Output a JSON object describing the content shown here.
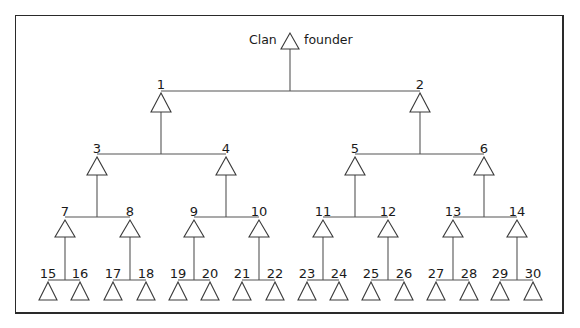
{
  "diagram": {
    "type": "kinship-tree",
    "root": {
      "left_label": "Clan",
      "right_label": "founder",
      "symbol": "triangle-male"
    },
    "colors": {
      "line": "#555555",
      "frame": "#2a2a2a",
      "text": "#1a1a1a",
      "background": "#ffffff"
    },
    "nodes": [
      {
        "id": "founder",
        "label": "",
        "parent": null
      },
      {
        "id": "1",
        "label": "1",
        "parent": "founder"
      },
      {
        "id": "2",
        "label": "2",
        "parent": "founder"
      },
      {
        "id": "3",
        "label": "3",
        "parent": "1"
      },
      {
        "id": "4",
        "label": "4",
        "parent": "1"
      },
      {
        "id": "5",
        "label": "5",
        "parent": "2"
      },
      {
        "id": "6",
        "label": "6",
        "parent": "2"
      },
      {
        "id": "7",
        "label": "7",
        "parent": "3"
      },
      {
        "id": "8",
        "label": "8",
        "parent": "3"
      },
      {
        "id": "9",
        "label": "9",
        "parent": "4"
      },
      {
        "id": "10",
        "label": "10",
        "parent": "4"
      },
      {
        "id": "11",
        "label": "11",
        "parent": "5"
      },
      {
        "id": "12",
        "label": "12",
        "parent": "5"
      },
      {
        "id": "13",
        "label": "13",
        "parent": "6"
      },
      {
        "id": "14",
        "label": "14",
        "parent": "6"
      },
      {
        "id": "15",
        "label": "15",
        "parent": "7"
      },
      {
        "id": "16",
        "label": "16",
        "parent": "7"
      },
      {
        "id": "17",
        "label": "17",
        "parent": "8"
      },
      {
        "id": "18",
        "label": "18",
        "parent": "8"
      },
      {
        "id": "19",
        "label": "19",
        "parent": "9"
      },
      {
        "id": "20",
        "label": "20",
        "parent": "9"
      },
      {
        "id": "21",
        "label": "21",
        "parent": "10"
      },
      {
        "id": "22",
        "label": "22",
        "parent": "10"
      },
      {
        "id": "23",
        "label": "23",
        "parent": "11"
      },
      {
        "id": "24",
        "label": "24",
        "parent": "11"
      },
      {
        "id": "25",
        "label": "25",
        "parent": "12"
      },
      {
        "id": "26",
        "label": "26",
        "parent": "12"
      },
      {
        "id": "27",
        "label": "27",
        "parent": "13"
      },
      {
        "id": "28",
        "label": "28",
        "parent": "13"
      },
      {
        "id": "29",
        "label": "29",
        "parent": "14"
      },
      {
        "id": "30",
        "label": "30",
        "parent": "14"
      }
    ]
  }
}
